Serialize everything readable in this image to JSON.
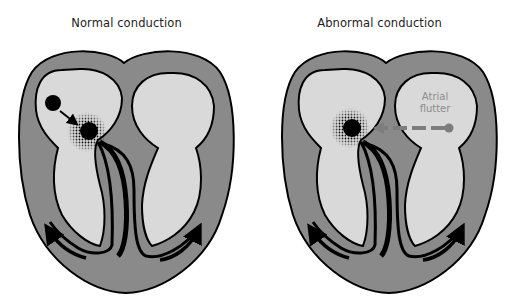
{
  "figure": {
    "colors": {
      "heart_wall": "#8a8a8a",
      "chamber_fill": "#d9d9d9",
      "outline": "#000000",
      "flutter_arrow": "#7d7d7d",
      "background": "#ffffff"
    },
    "panels": [
      {
        "title": "Normal conduction",
        "elements": [
          "sinoatrial-node",
          "arrow-to-av-node",
          "av-node-with-dotted-halo",
          "bundle-branches",
          "ventricular-spread-arrows"
        ]
      },
      {
        "title": "Abnormal conduction",
        "annotation": {
          "line1": "Atrial",
          "line2": "flutter"
        },
        "elements": [
          "av-node-with-dotted-halo",
          "dashed-flutter-arrow",
          "bundle-branches",
          "ventricular-spread-arrows"
        ]
      }
    ]
  }
}
